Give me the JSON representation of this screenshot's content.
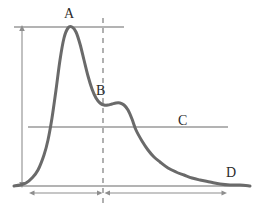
{
  "figure": {
    "type": "annotated-curve-diagram",
    "background_color": "#ffffff",
    "curve_color": "#6a6a6a",
    "guide_color": "#9a9a9a",
    "dashed_color": "#a8a8a8",
    "label_color": "#2b2b2b",
    "width": 254,
    "height": 217
  },
  "labels": {
    "peak": "A",
    "shoulder": "B",
    "midline": "C",
    "tail": "D"
  },
  "chart_data": {
    "type": "line",
    "title": "",
    "xlabel": "",
    "ylabel": "",
    "grid": false,
    "legend": null,
    "xlim": [
      0,
      254
    ],
    "ylim": [
      0,
      217
    ],
    "annotations": [
      {
        "label": "A",
        "role": "primary-peak-maximum",
        "x": 68,
        "y": 27,
        "text_x": 68,
        "text_y": 14
      },
      {
        "label": "B",
        "role": "secondary-shoulder",
        "x": 107,
        "y": 104,
        "text_x": 100,
        "text_y": 91
      },
      {
        "label": "C",
        "role": "mid-horizontal-reference-line",
        "x": 183,
        "y": 127,
        "text_x": 183,
        "text_y": 121
      },
      {
        "label": "D",
        "role": "baseline-tail-asymptote",
        "x": 238,
        "y": 185,
        "text_x": 231,
        "text_y": 173
      }
    ],
    "series": [
      {
        "name": "curve",
        "x": [
          14,
          20,
          26,
          32,
          38,
          44,
          48,
          52,
          56,
          60,
          64,
          68,
          72,
          76,
          80,
          84,
          88,
          92,
          96,
          100,
          104,
          108,
          112,
          116,
          120,
          124,
          128,
          132,
          136,
          142,
          148,
          154,
          160,
          168,
          176,
          184,
          192,
          200,
          210,
          220,
          230,
          240,
          250
        ],
        "y": [
          186,
          185,
          183,
          178,
          170,
          155,
          140,
          118,
          90,
          60,
          38,
          28,
          27,
          32,
          44,
          60,
          76,
          89,
          98,
          103,
          105,
          105,
          104,
          103,
          103,
          105,
          110,
          119,
          130,
          141,
          150,
          157,
          162,
          168,
          172,
          175,
          178,
          180,
          182,
          184,
          185,
          185,
          186
        ]
      }
    ],
    "reference_lines": [
      {
        "name": "top-line",
        "orientation": "horizontal",
        "y": 27,
        "x_start": 14,
        "x_end": 124
      },
      {
        "name": "mid-line",
        "orientation": "horizontal",
        "y": 127,
        "x_start": 28,
        "x_end": 228
      },
      {
        "name": "baseline",
        "orientation": "horizontal",
        "y": 186,
        "x_start": 14,
        "x_end": 250
      },
      {
        "name": "dashed-vertical-at-B",
        "orientation": "vertical",
        "x": 103,
        "y_start": 18,
        "y_end": 205,
        "style": "dashed"
      }
    ],
    "measure_arrows": [
      {
        "name": "vertical-height-arrow",
        "orientation": "vertical",
        "x": 22,
        "y_start": 27,
        "y_end": 186,
        "heads": "both"
      },
      {
        "name": "horizontal-left-span-arrow",
        "orientation": "horizontal",
        "y": 193,
        "x_start": 30,
        "x_end": 101,
        "heads": "both"
      },
      {
        "name": "horizontal-right-span-arrow",
        "orientation": "horizontal",
        "y": 193,
        "x_start": 105,
        "x_end": 226,
        "heads": "both"
      }
    ]
  }
}
